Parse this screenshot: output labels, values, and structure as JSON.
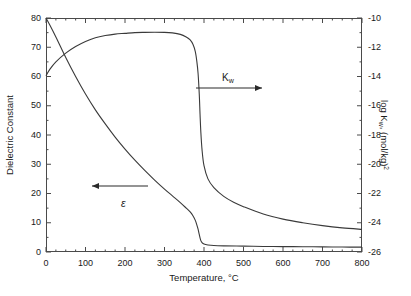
{
  "chart_data": {
    "type": "line",
    "title": "",
    "xlabel": "Temperature, °C",
    "ylabel_left": "Dielectric Constant",
    "ylabel_right": "log K",
    "ylabel_right_sub": "w",
    "ylabel_right_tail": ", (mol/kg)",
    "ylabel_right_sup": "2",
    "xlim": [
      0,
      800
    ],
    "ylim_left": [
      0,
      80
    ],
    "ylim_right": [
      -26,
      -10
    ],
    "xticks": [
      0,
      100,
      200,
      300,
      400,
      500,
      600,
      700,
      800
    ],
    "xtick_labels": [
      "0",
      "100",
      "200",
      "300",
      "400",
      "500",
      "600",
      "700",
      "800"
    ],
    "xminor_step": 25,
    "yticks_left": [
      0,
      10,
      20,
      30,
      40,
      50,
      60,
      70,
      80
    ],
    "ytick_left_labels": [
      "0",
      "10",
      "20",
      "30",
      "40",
      "50",
      "60",
      "70",
      "80"
    ],
    "yminor_left_step": 5,
    "yticks_right": [
      -26,
      -24,
      -22,
      -20,
      -18,
      -16,
      -14,
      -12,
      -10
    ],
    "ytick_right_labels": [
      "-26",
      "-24",
      "-22",
      "-20",
      "-18",
      "-16",
      "-14",
      "-12",
      "-10"
    ],
    "yminor_right_step": 1,
    "grid": false,
    "legend_position": "inline-annotations",
    "annotations": [
      {
        "name": "kw-label",
        "text": "K",
        "sub": "w",
        "arrow": "right",
        "x_px": 222,
        "y_px": 72,
        "arrow_x1_px": 196,
        "arrow_x2_px": 262,
        "arrow_y_px": 88
      },
      {
        "name": "epsilon-label",
        "text": "ε",
        "arrow": "left",
        "x_px": 121,
        "y_px": 197,
        "arrow_x1_px": 148,
        "arrow_x2_px": 92,
        "arrow_y_px": 186
      }
    ],
    "series": [
      {
        "name": "Dielectric Constant",
        "axis": "left",
        "x": [
          0,
          10,
          25,
          50,
          75,
          100,
          125,
          150,
          175,
          200,
          225,
          250,
          275,
          300,
          320,
          340,
          355,
          365,
          372,
          378,
          382,
          385,
          388,
          390,
          392,
          395,
          400,
          410,
          425,
          450,
          500,
          550,
          600,
          650,
          700,
          750,
          800
        ],
        "y": [
          80.0,
          77.5,
          73.5,
          66.5,
          60.0,
          54.0,
          48.6,
          43.8,
          39.3,
          35.2,
          31.4,
          27.9,
          24.6,
          21.5,
          19.2,
          16.9,
          15.0,
          13.7,
          12.4,
          10.8,
          9.2,
          7.8,
          6.0,
          4.8,
          3.9,
          3.2,
          2.7,
          2.4,
          2.2,
          2.1,
          2.0,
          1.9,
          1.85,
          1.8,
          1.75,
          1.7,
          1.65
        ]
      },
      {
        "name": "log Kw",
        "axis": "right",
        "x": [
          0,
          10,
          25,
          50,
          75,
          100,
          125,
          150,
          175,
          200,
          225,
          250,
          275,
          300,
          320,
          340,
          355,
          365,
          372,
          378,
          382,
          385,
          388,
          390,
          392,
          395,
          400,
          410,
          425,
          450,
          475,
          500,
          550,
          600,
          650,
          700,
          750,
          800
        ],
        "y": [
          -13.95,
          -13.5,
          -13.0,
          -12.4,
          -11.95,
          -11.6,
          -11.35,
          -11.2,
          -11.1,
          -11.05,
          -11.0,
          -10.98,
          -10.97,
          -10.98,
          -11.02,
          -11.12,
          -11.3,
          -11.5,
          -11.8,
          -12.3,
          -13.0,
          -13.8,
          -15.2,
          -16.6,
          -17.8,
          -19.0,
          -20.1,
          -21.0,
          -21.6,
          -22.2,
          -22.6,
          -22.9,
          -23.4,
          -23.75,
          -24.0,
          -24.2,
          -24.35,
          -24.45
        ]
      }
    ]
  },
  "axes": {
    "left_title": "Dielectric Constant",
    "x_title": "Temperature, °C"
  },
  "colors": {
    "curve": "#3a3a3a",
    "frame": "#4a4a4a",
    "text": "#1a1a1a",
    "arrow": "#2a2a2a"
  }
}
